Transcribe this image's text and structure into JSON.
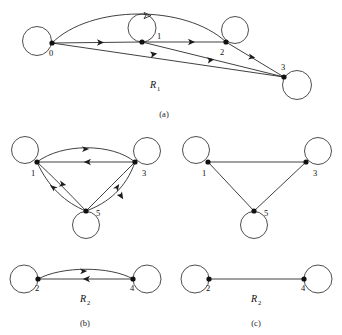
{
  "figure": {
    "background_color": "#ffffff",
    "stroke_color": "#2b2b2b",
    "node_fill": "#111111",
    "panels": [
      {
        "id": "a",
        "caption": "(a)",
        "relation_label": "R",
        "relation_subscript": "1",
        "graph_type": "directed",
        "nodes": [
          {
            "id": "0",
            "label": "0",
            "x": 52,
            "y": 43,
            "loop": "left"
          },
          {
            "id": "1",
            "label": "1",
            "x": 142,
            "y": 42,
            "loop": "up"
          },
          {
            "id": "2",
            "label": "2",
            "x": 226,
            "y": 42,
            "loop": "up-right"
          },
          {
            "id": "3",
            "label": "3",
            "x": 284,
            "y": 77,
            "loop": "down-right"
          }
        ],
        "edges": [
          {
            "from": "0",
            "to": "2",
            "style": "arc-high"
          },
          {
            "from": "0",
            "to": "1",
            "style": "straight"
          },
          {
            "from": "1",
            "to": "2",
            "style": "straight"
          },
          {
            "from": "0",
            "to": "3",
            "style": "straight"
          },
          {
            "from": "1",
            "to": "3",
            "style": "straight"
          },
          {
            "from": "2",
            "to": "3",
            "style": "straight"
          }
        ],
        "self_loops": [
          "0",
          "1",
          "2",
          "3"
        ]
      },
      {
        "id": "b",
        "caption": "(b)",
        "relation_label": "R",
        "relation_subscript": "2",
        "graph_type": "directed",
        "nodes": [
          {
            "id": "1",
            "label": "1",
            "x": 37,
            "y": 162,
            "loop": "upper-left"
          },
          {
            "id": "3",
            "label": "3",
            "x": 135,
            "y": 162,
            "loop": "upper-right"
          },
          {
            "id": "5",
            "label": "5",
            "x": 86,
            "y": 211,
            "loop": "down"
          },
          {
            "id": "2",
            "label": "2",
            "x": 38,
            "y": 279,
            "loop": "left"
          },
          {
            "id": "4",
            "label": "4",
            "x": 133,
            "y": 279,
            "loop": "right"
          }
        ],
        "edges": [
          {
            "from": "1",
            "to": "3",
            "style": "arc-up"
          },
          {
            "from": "3",
            "to": "1",
            "style": "straight"
          },
          {
            "from": "1",
            "to": "5",
            "style": "arc"
          },
          {
            "from": "5",
            "to": "1",
            "style": "arc"
          },
          {
            "from": "5",
            "to": "3",
            "style": "arc"
          },
          {
            "from": "3",
            "to": "5",
            "style": "arc"
          },
          {
            "from": "2",
            "to": "4",
            "style": "arc-up"
          },
          {
            "from": "4",
            "to": "2",
            "style": "straight"
          }
        ],
        "self_loops": [
          "1",
          "3",
          "5",
          "2",
          "4"
        ]
      },
      {
        "id": "c",
        "caption": "(c)",
        "relation_label": "R",
        "relation_subscript": "2",
        "graph_type": "undirected",
        "nodes": [
          {
            "id": "1",
            "label": "1",
            "x": 208,
            "y": 162,
            "loop": "upper-left"
          },
          {
            "id": "3",
            "label": "3",
            "x": 306,
            "y": 162,
            "loop": "upper-right"
          },
          {
            "id": "5",
            "label": "5",
            "x": 254,
            "y": 211,
            "loop": "down"
          },
          {
            "id": "2",
            "label": "2",
            "x": 209,
            "y": 279,
            "loop": "left"
          },
          {
            "id": "4",
            "label": "4",
            "x": 304,
            "y": 279,
            "loop": "right"
          }
        ],
        "edges": [
          {
            "from": "1",
            "to": "3",
            "style": "straight"
          },
          {
            "from": "1",
            "to": "5",
            "style": "straight"
          },
          {
            "from": "5",
            "to": "3",
            "style": "straight"
          },
          {
            "from": "2",
            "to": "4",
            "style": "straight"
          }
        ],
        "self_loops": [
          "1",
          "3",
          "5",
          "2",
          "4"
        ]
      }
    ]
  },
  "labels": {
    "a_n0": "0",
    "a_n1": "1",
    "a_n2": "2",
    "a_n3": "3",
    "a_rel": "R",
    "a_rel_sub": "1",
    "a_caption": "(a)",
    "b_n1": "1",
    "b_n3": "3",
    "b_n5": "5",
    "b_n2": "2",
    "b_n4": "4",
    "b_rel": "R",
    "b_rel_sub": "2",
    "b_caption": "(b)",
    "c_n1": "1",
    "c_n3": "3",
    "c_n5": "5",
    "c_n2": "2",
    "c_n4": "4",
    "c_rel": "R",
    "c_rel_sub": "2",
    "c_caption": "(c)"
  }
}
